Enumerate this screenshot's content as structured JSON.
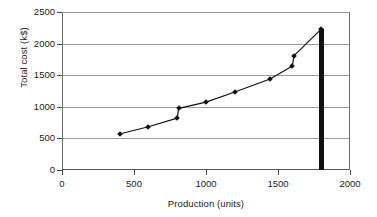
{
  "chart_data": {
    "type": "line",
    "title": "",
    "subtitle": "",
    "xlabel": "Production (units)",
    "ylabel": "Total cost (k$)",
    "xlim": [
      0,
      2000
    ],
    "ylim": [
      0,
      2500
    ],
    "xticks": [
      0,
      500,
      1000,
      1500,
      2000
    ],
    "yticks": [
      0,
      500,
      1000,
      1500,
      2000,
      2500
    ],
    "xtick_labels": [
      "0",
      "500",
      "1000",
      "1500",
      "2000"
    ],
    "ytick_labels": [
      "0",
      "500",
      "1000",
      "1500",
      "2000",
      "2500"
    ],
    "grid": "horizontal",
    "legend": "none",
    "series": [
      {
        "name": "Total cost",
        "marker": "diamond",
        "marker_color": "#111111",
        "line_color": "#111111",
        "x": [
          400,
          600,
          800,
          810,
          1000,
          1200,
          1445,
          1600,
          1610,
          1800
        ],
        "y": [
          570,
          685,
          820,
          975,
          1075,
          1235,
          1440,
          1645,
          1805,
          2230
        ]
      }
    ],
    "annotations": [
      {
        "name": "capacity-limit-bar",
        "type": "vertical-bar",
        "x": 1800,
        "y_from": 0,
        "y_to": 2230,
        "color": "#111111"
      }
    ]
  },
  "axes": {
    "y_title": "Total cost (k$)",
    "x_title": "Production (units)"
  }
}
